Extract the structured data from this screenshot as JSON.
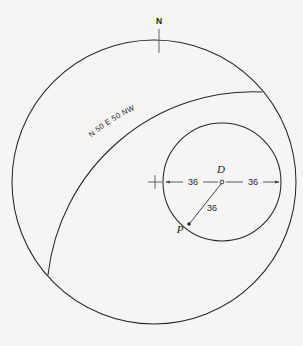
{
  "figure": {
    "background_color": "#f6f5f3",
    "line_color": "#26262a"
  },
  "labels": {
    "north": "N",
    "bearing": "N 50 E 50 NW",
    "point_d": "D",
    "point_p": "P",
    "dim_left": "36",
    "dim_right": "36",
    "dim_radius": "36"
  },
  "geometry": {
    "outer_circle": {
      "cx": 154,
      "cy": 182,
      "r": 142
    },
    "inner_circle": {
      "cx": 222,
      "cy": 182,
      "r": 59
    },
    "sweep_arc": {
      "start_x": 262,
      "start_y": 92,
      "end_x": 48,
      "end_y": 275,
      "rx": 205,
      "ry": 205
    },
    "center_cross": {
      "x": 155,
      "y": 182,
      "size": 7
    },
    "point_d": {
      "x": 222,
      "y": 182
    },
    "point_p": {
      "x": 189,
      "y": 224
    },
    "north_tick": {
      "x": 159,
      "y_top": 29,
      "y_bottom": 52
    }
  },
  "dimensions": {
    "left_arrow": {
      "from_x": 222,
      "from_y": 182,
      "to_x": 165,
      "to_y": 182,
      "value": "36"
    },
    "right_arrow": {
      "from_x": 222,
      "from_y": 182,
      "to_x": 280,
      "to_y": 182,
      "value": "36"
    },
    "radius_line": {
      "from_x": 222,
      "from_y": 182,
      "to_x": 189,
      "to_y": 224,
      "value": "36"
    }
  }
}
